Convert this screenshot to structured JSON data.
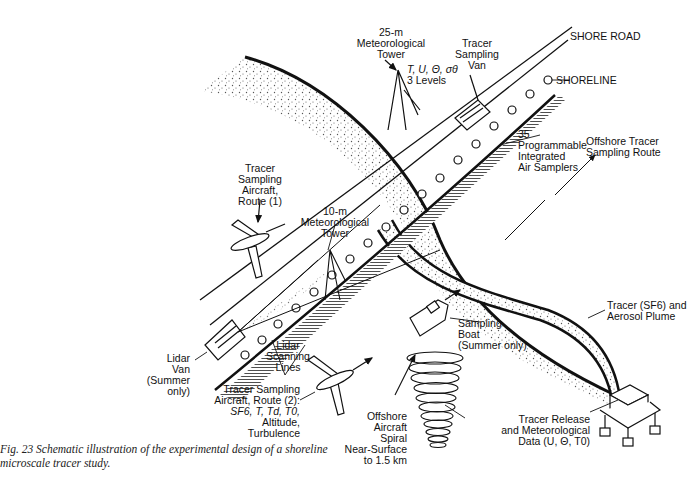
{
  "figure": {
    "caption_line1": "Fig. 23  Schematic illustration of the experimental design of a shoreline",
    "caption_line2": "microscale tracer study."
  },
  "labels": {
    "met_tower_25m": [
      "25-m",
      "Meteorological",
      "Tower"
    ],
    "met_vars_25m": [
      "T, U, Θ, σθ",
      "3 Levels"
    ],
    "tracer_sampling_van": [
      "Tracer",
      "Sampling",
      "Van"
    ],
    "shore_road": "SHORE ROAD",
    "shoreline": "SHORELINE",
    "air_samplers": [
      "35",
      "Programmable",
      "Integrated",
      "Air Samplers"
    ],
    "offshore_route": [
      "Offshore Tracer",
      "Sampling Route"
    ],
    "aircraft_route1": [
      "Tracer",
      "Sampling",
      "Aircraft,",
      "Route (1)"
    ],
    "met_tower_10m": [
      "10-m",
      "Meteorological",
      "Tower"
    ],
    "lidar_van": [
      "Lidar",
      "Van",
      "(Summer",
      "only)"
    ],
    "lidar_lines": [
      "Lidar",
      "Scanning",
      "Lines"
    ],
    "aircraft_route2": [
      "Tracer Sampling",
      "Aircraft, Route (2):",
      "SF6, T, Td, T0,",
      "Altitude,",
      "Turbulence"
    ],
    "sampling_boat": [
      "Sampling",
      "Boat",
      "(Summer only)"
    ],
    "plume": [
      "Tracer (SF6) and",
      "Aerosol Plume"
    ],
    "aircraft_spiral": [
      "Offshore",
      "Aircraft",
      "Spiral",
      "Near-Surface",
      "to 1.5 km"
    ],
    "tracer_release": [
      "Tracer Release",
      "and Meteorological",
      "Data (U, Θ, T0)"
    ]
  },
  "colors": {
    "ink": "#111111",
    "stipple": "#555555",
    "paper": "#ffffff"
  }
}
